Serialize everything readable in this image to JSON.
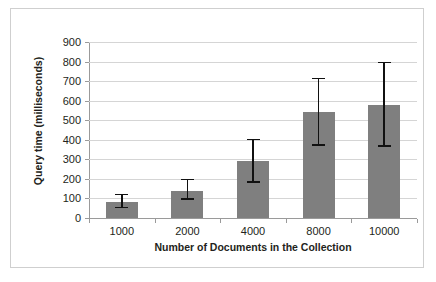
{
  "chart_data": {
    "type": "bar",
    "title": "",
    "xlabel": "Number of Documents in the Collection",
    "ylabel": "Query time (milliseconds)",
    "categories": [
      "1000",
      "2000",
      "4000",
      "8000",
      "10000"
    ],
    "values": [
      83,
      140,
      290,
      543,
      580
    ],
    "error_upper": [
      125,
      200,
      405,
      718,
      800
    ],
    "error_lower": [
      50,
      92,
      180,
      370,
      363
    ],
    "ylim": [
      0,
      900
    ],
    "yticks": [
      "0",
      "100",
      "200",
      "300",
      "400",
      "500",
      "600",
      "700",
      "800",
      "900"
    ],
    "ytick_values": [
      0,
      100,
      200,
      300,
      400,
      500,
      600,
      700,
      800,
      900
    ],
    "grid": true,
    "legend": "none",
    "series": [
      {
        "name": "Query time",
        "values": [
          83,
          140,
          290,
          543,
          580
        ]
      }
    ],
    "colors": {
      "bar_fill": "#7f7f7f",
      "error_bar": "#111111",
      "gridline": "#d5d5d5",
      "axis": "#9a9a9a",
      "text": "#231f20",
      "frame_border": "#cfcfcf",
      "background": "#ffffff"
    }
  }
}
